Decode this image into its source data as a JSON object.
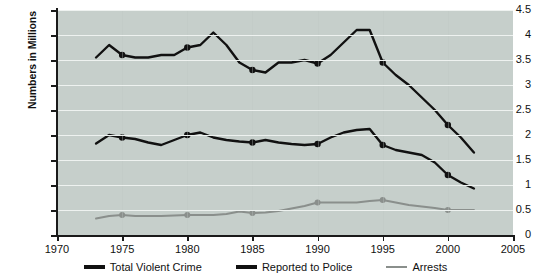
{
  "chart_data": {
    "type": "line",
    "title": "",
    "xlabel": "",
    "ylabel": "Numbers in Millions",
    "xlim": [
      1970,
      2005
    ],
    "ylim": [
      0,
      4.5
    ],
    "xticks": [
      1970,
      1975,
      1980,
      1985,
      1990,
      1995,
      2000,
      2005
    ],
    "yticks": [
      0,
      0.5,
      1,
      1.5,
      2,
      2.5,
      3,
      3.5,
      4,
      4.5
    ],
    "grid": "horizontal",
    "legend_position": "bottom",
    "plot_background": "#c6cfcb",
    "x": [
      1973,
      1974,
      1975,
      1976,
      1977,
      1978,
      1979,
      1980,
      1981,
      1982,
      1983,
      1984,
      1985,
      1986,
      1987,
      1988,
      1989,
      1990,
      1991,
      1992,
      1993,
      1994,
      1995,
      1996,
      1997,
      1998,
      1999,
      2000,
      2001,
      2002
    ],
    "series": [
      {
        "name": "Total Violent Crime",
        "color": "#111111",
        "marker_years": [
          1975,
          1980,
          1985,
          1990,
          1995,
          2000
        ],
        "values": [
          3.55,
          3.8,
          3.6,
          3.55,
          3.55,
          3.6,
          3.6,
          3.75,
          3.8,
          4.05,
          3.8,
          3.45,
          3.3,
          3.25,
          3.45,
          3.45,
          3.5,
          3.43,
          3.6,
          3.85,
          4.1,
          4.1,
          3.45,
          3.2,
          3.0,
          2.75,
          2.5,
          2.2,
          1.95,
          1.65
        ]
      },
      {
        "name": "Reported to Police",
        "color": "#111111",
        "marker_years": [
          1975,
          1980,
          1985,
          1990,
          1995,
          2000
        ],
        "values": [
          1.83,
          2.0,
          1.95,
          1.92,
          1.85,
          1.8,
          1.9,
          2.0,
          2.05,
          1.95,
          1.9,
          1.87,
          1.85,
          1.9,
          1.85,
          1.82,
          1.8,
          1.82,
          1.95,
          2.05,
          2.1,
          2.12,
          1.8,
          1.7,
          1.65,
          1.6,
          1.45,
          1.2,
          1.05,
          0.93
        ]
      },
      {
        "name": "Arrests",
        "color": "#8a8f8c",
        "marker_years": [
          1975,
          1980,
          1985,
          1990,
          1995,
          2000
        ],
        "values": [
          0.33,
          0.38,
          0.4,
          0.38,
          0.38,
          0.38,
          0.39,
          0.4,
          0.4,
          0.4,
          0.42,
          0.47,
          0.44,
          0.45,
          0.48,
          0.53,
          0.58,
          0.65,
          0.65,
          0.65,
          0.65,
          0.68,
          0.7,
          0.65,
          0.6,
          0.57,
          0.54,
          0.5,
          0.5,
          0.5
        ]
      }
    ]
  },
  "axis": {
    "ylabel": "Numbers in Millions",
    "ytick_labels": [
      "4.5",
      "4",
      "3.5",
      "3",
      "2.5",
      "2",
      "1.5",
      "1",
      "0.5",
      "0"
    ],
    "xtick_labels": [
      "1970",
      "1975",
      "1980",
      "1985",
      "1990",
      "1995",
      "2000",
      "2005"
    ]
  },
  "legend": {
    "items": [
      {
        "label": "Total Violent Crime",
        "color": "#111111"
      },
      {
        "label": "Reported to Police",
        "color": "#111111"
      },
      {
        "label": "Arrests",
        "color": "#8a8f8c"
      }
    ]
  }
}
